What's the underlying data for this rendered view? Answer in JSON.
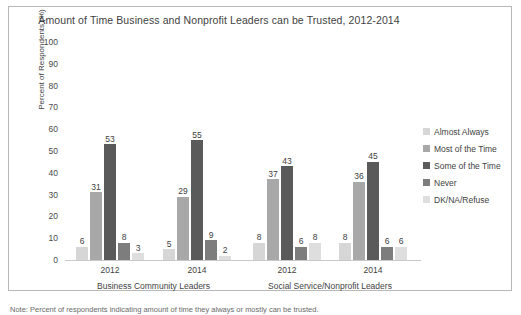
{
  "chart_data": {
    "type": "bar",
    "title": "Amount of Time Business and Nonprofit Leaders can be Trusted, 2012-2014",
    "xlabel": "",
    "ylabel": "Percent of Respondents (%)",
    "ylim": [
      0,
      100
    ],
    "ytick_labels": [
      "100",
      "90",
      "80",
      "70",
      "60",
      "50",
      "40",
      "30",
      "20",
      "10",
      "0"
    ],
    "ytick_values": [
      100,
      90,
      80,
      70,
      60,
      50,
      40,
      30,
      20,
      10,
      0
    ],
    "grid": false,
    "legend_position": "right",
    "categories": [
      "2012",
      "2014",
      "2012",
      "2014"
    ],
    "group_labels": [
      "Business Community Leaders",
      "Social Service/Nonprofit Leaders"
    ],
    "series": [
      {
        "name": "Almost Always",
        "color": "#d6d6d6",
        "values": [
          6,
          5,
          8,
          8
        ]
      },
      {
        "name": "Most of the Time",
        "color": "#a8a8a8",
        "values": [
          31,
          29,
          37,
          36
        ]
      },
      {
        "name": "Some of the Time",
        "color": "#5a5a5a",
        "values": [
          53,
          55,
          43,
          45
        ]
      },
      {
        "name": "Never",
        "color": "#7d7d7d",
        "values": [
          8,
          9,
          6,
          6
        ]
      },
      {
        "name": "DK/NA/Refuse",
        "color": "#dedede",
        "values": [
          3,
          2,
          8,
          6
        ]
      }
    ]
  },
  "footnote": {
    "text": "Note: Percent of respondents indicating amount of time they always or mostly can be trusted."
  }
}
